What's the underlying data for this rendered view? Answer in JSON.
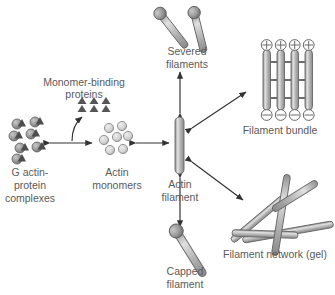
{
  "diagram": {
    "background_color": "#ffffff",
    "label_color": "#5a5a5a",
    "rod_fill_light": "#d6d6d6",
    "rod_fill_mid": "#9a9a9a",
    "rod_stroke": "#555555",
    "arrow_color": "#333333",
    "triangle_fill": "#555555"
  },
  "labels": {
    "monomer_binding_proteins_line1": "Monomer-binding",
    "monomer_binding_proteins_line2": "proteins",
    "g_actin_line1": "G actin-",
    "g_actin_line2": "protein",
    "g_actin_line3": "complexes",
    "actin_monomers_line1": "Actin",
    "actin_monomers_line2": "monomers",
    "actin_filament_line1": "Actin",
    "actin_filament_line2": "filament",
    "severed_filaments_line1": "Severed",
    "severed_filaments_line2": "filaments",
    "capped_filament_line1": "Capped",
    "capped_filament_line2": "filament",
    "filament_bundle": "Filament bundle",
    "filament_network": "Filament network (gel)"
  },
  "bundle": {
    "plus_sign": "⊕",
    "minus_sign": "⊖",
    "filament_count": 4,
    "crosslink_count": 3
  },
  "clusters": {
    "monomer_binding_protein_triangle_count": 6,
    "g_actin_complex_count": 7,
    "actin_monomer_count": 7
  },
  "severed": {
    "fragment_count": 2
  },
  "network": {
    "rod_count": 5
  }
}
